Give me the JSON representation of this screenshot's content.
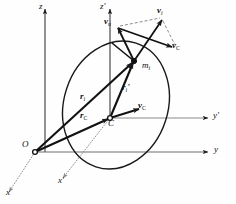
{
  "figure": {
    "type": "vector-diagram",
    "background_color": "#fefefe",
    "line_color": "#1a1a1a",
    "dashed_color": "#7a7a7a"
  },
  "axes": {
    "fixed": {
      "z_label": "z",
      "y_label": "y",
      "x_label": "x",
      "origin_label": "O"
    },
    "moving": {
      "z_label": "z'",
      "y_label": "y'",
      "x_label": "x'",
      "origin_label": "C"
    }
  },
  "points": {
    "origin": {
      "name": "O",
      "x": 35,
      "y": 152
    },
    "center_of_mass": {
      "name": "C",
      "x": 110,
      "y": 118
    },
    "particle": {
      "name": "m",
      "subscript": "i",
      "x": 134,
      "y": 61
    }
  },
  "vectors": [
    {
      "id": "r_i",
      "symbol": "r",
      "subscript": "i",
      "prime": "",
      "label_x": 84,
      "label_y": 94
    },
    {
      "id": "r_c",
      "symbol": "r",
      "subscript": "C",
      "prime": "",
      "label_x": 84,
      "label_y": 113
    },
    {
      "id": "r_i_prime",
      "symbol": "r",
      "subscript": "i",
      "prime": "'",
      "label_x": 124,
      "label_y": 85
    },
    {
      "id": "v_rel",
      "symbol": "v",
      "subscript": "u",
      "prime": "",
      "label_x": 107,
      "label_y": 19
    },
    {
      "id": "v_i",
      "symbol": "v",
      "subscript": "i",
      "prime": "",
      "label_x": 159,
      "label_y": 9
    },
    {
      "id": "v_C_top",
      "symbol": "v",
      "subscript": "C",
      "prime": "",
      "label_x": 174,
      "label_y": 43
    },
    {
      "id": "v_C_mid",
      "symbol": "v",
      "subscript": "C",
      "prime": "",
      "label_x": 140,
      "label_y": 103
    }
  ],
  "labels": {
    "z": "z",
    "z_prime": "z'",
    "y": "y",
    "y_prime": "y'",
    "x": "x",
    "x_prime": "x'",
    "O": "O",
    "C": "C",
    "m": "m",
    "i": "i",
    "v": "v",
    "r": "r",
    "sub_i": "i",
    "sub_C": "C",
    "sub_u": "u",
    "prime": "'"
  }
}
